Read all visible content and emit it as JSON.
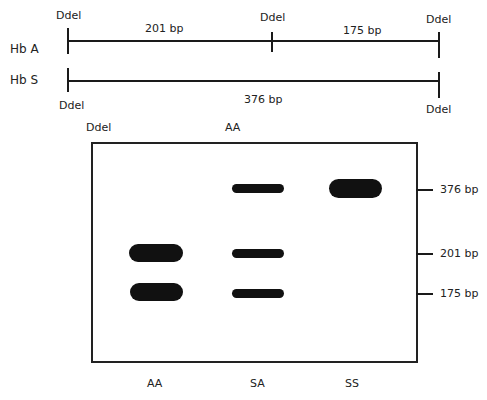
{
  "restriction_map": {
    "hbA": {
      "label": "Hb A",
      "sites": [
        "Ddel",
        "Ddel",
        "Ddel"
      ],
      "fragments": [
        "201 bp",
        "175 bp"
      ]
    },
    "hbS": {
      "label": "Hb S",
      "sites": [
        "Ddel",
        "Ddel"
      ],
      "fragments": [
        "376 bp"
      ]
    }
  },
  "gel": {
    "header_labels": [
      "Ddel",
      "AA"
    ],
    "lanes": [
      {
        "label": "AA",
        "bands": [
          "201 bp",
          "175 bp"
        ]
      },
      {
        "label": "SA",
        "bands": [
          "376 bp",
          "201 bp",
          "175 bp"
        ]
      },
      {
        "label": "SS",
        "bands": [
          "376 bp"
        ]
      }
    ],
    "markers": [
      "376 bp",
      "201 bp",
      "175 bp"
    ]
  }
}
